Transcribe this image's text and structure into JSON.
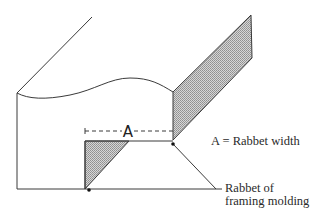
{
  "diagram": {
    "dimension_label": "A",
    "legend": "A = Rabbet width",
    "callout_line1": "Rabbet of",
    "callout_line2": "framing molding",
    "colors": {
      "line": "#3a3a3a",
      "shade": "#b8b8b8",
      "background": "#ffffff"
    }
  }
}
